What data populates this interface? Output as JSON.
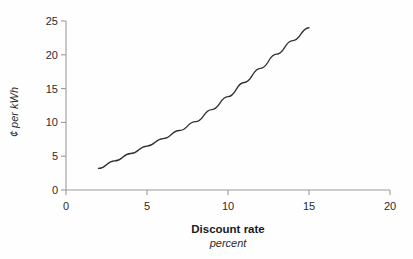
{
  "chart_data": {
    "type": "line",
    "title": "",
    "xlabel": "Discount rate",
    "xlabel_sub": "percent",
    "ylabel": "¢ per kWh",
    "xlim": [
      0,
      20
    ],
    "ylim": [
      0,
      25
    ],
    "grid": false,
    "legend": "none",
    "xticks": [
      "0",
      "5",
      "10",
      "15",
      "20"
    ],
    "xtick_values": [
      0,
      5,
      10,
      15,
      20
    ],
    "yticks": [
      "0",
      "5",
      "10",
      "15",
      "20",
      "25"
    ],
    "ytick_values": [
      0,
      5,
      10,
      15,
      20,
      25
    ],
    "series": [
      {
        "name": "Cost of electricity",
        "x": [
          2,
          3,
          4,
          5,
          6,
          7,
          8,
          9,
          10,
          11,
          12,
          13,
          14,
          15
        ],
        "values": [
          3.2,
          4.3,
          5.4,
          6.5,
          7.6,
          8.8,
          10.1,
          11.9,
          13.8,
          15.9,
          18.0,
          20.1,
          22.1,
          24.0
        ],
        "color": "#303030"
      }
    ]
  },
  "style": {
    "axis_color": "#9a9a9a",
    "tick_color": "#9a9a9a",
    "text_color": "#2b2b2b",
    "background": "#fefefe",
    "line_color": "#303030"
  }
}
